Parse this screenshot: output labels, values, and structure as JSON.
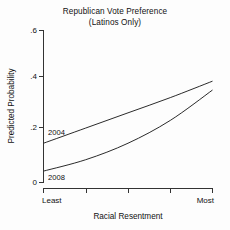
{
  "chart_data": {
    "type": "line",
    "title": "Republican Vote Preference",
    "subtitle": "(Latinos Only)",
    "xlabel": "Racial Resentment",
    "ylabel": "Predicted Probability",
    "ylim": [
      0,
      0.6
    ],
    "xlim": [
      0,
      1
    ],
    "grid": false,
    "legend_position": "inline-labels",
    "y_ticks": [
      "0",
      ".2",
      ".4",
      ".6"
    ],
    "y_tick_values": [
      0,
      0.2,
      0.4,
      0.6
    ],
    "x_tick_count": 5,
    "x_tick_labels": [
      "Least",
      "",
      "",
      "",
      "Most"
    ],
    "x_axis_low_label": "Least",
    "x_axis_high_label": "Most",
    "series": [
      {
        "name": "2004",
        "label": "2004",
        "color": "#2b2b2b",
        "x": [
          0,
          0.25,
          0.5,
          0.75,
          1
        ],
        "values": [
          0.155,
          0.215,
          0.275,
          0.335,
          0.4
        ]
      },
      {
        "name": "2008",
        "label": "2008",
        "color": "#2b2b2b",
        "x": [
          0,
          0.25,
          0.5,
          0.75,
          1
        ],
        "values": [
          0.045,
          0.09,
          0.155,
          0.245,
          0.365
        ]
      }
    ]
  },
  "figure": {
    "background_color": "#fdfdfd",
    "axis_color": "#333333",
    "line_color": "#2b2b2b"
  }
}
